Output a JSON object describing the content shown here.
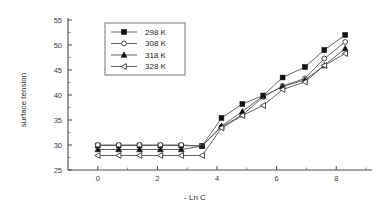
{
  "chart_data": {
    "type": "line",
    "title": "",
    "xlabel": "- Ln C",
    "ylabel": "surface tension",
    "xlim": [
      -1.0,
      9.2
    ],
    "ylim": [
      25,
      55
    ],
    "xticks": [
      0,
      2,
      4,
      6,
      8
    ],
    "xtick_labels": [
      "0",
      "2",
      "4",
      "6",
      "8"
    ],
    "yticks": [
      25,
      30,
      35,
      40,
      45,
      50,
      55
    ],
    "ytick_labels": [
      "25",
      "30",
      "35",
      "40",
      "45",
      "50",
      "55"
    ],
    "xminor_ticks": [
      1,
      3,
      5,
      7,
      9
    ],
    "yminor_ticks": [
      27.5,
      32.5,
      37.5,
      42.5,
      47.5,
      52.5
    ],
    "grid": false,
    "legend_position": "upper-left",
    "x": [
      0.0,
      0.7,
      1.4,
      2.1,
      2.8,
      3.5,
      4.15,
      4.85,
      5.55,
      6.2,
      6.95,
      7.6,
      8.3
    ],
    "series": [
      {
        "name": "298 K",
        "marker": "filled-square",
        "values": [
          29.9,
          29.9,
          29.9,
          29.9,
          29.9,
          29.8,
          35.4,
          38.2,
          39.9,
          43.5,
          45.6,
          49.0,
          52.0
        ]
      },
      {
        "name": "308 K",
        "marker": "open-circle",
        "values": [
          30.0,
          30.0,
          30.0,
          30.0,
          30.0,
          29.8,
          33.6,
          36.0,
          39.6,
          41.8,
          43.3,
          47.3,
          50.6
        ]
      },
      {
        "name": "318 K",
        "marker": "filled-triangle",
        "values": [
          29.1,
          29.1,
          29.1,
          29.1,
          29.1,
          29.8,
          33.8,
          36.7,
          39.8,
          41.7,
          43.0,
          45.9,
          49.3
        ]
      },
      {
        "name": "328 K",
        "marker": "open-left-triangle",
        "values": [
          27.9,
          27.9,
          27.9,
          27.9,
          27.9,
          27.9,
          33.4,
          35.9,
          37.9,
          41.1,
          42.6,
          45.9,
          48.3
        ]
      }
    ]
  },
  "legend": {
    "entries": [
      {
        "label": "298 K"
      },
      {
        "label": "308 K"
      },
      {
        "label": "318 K"
      },
      {
        "label": "328 K"
      }
    ]
  }
}
